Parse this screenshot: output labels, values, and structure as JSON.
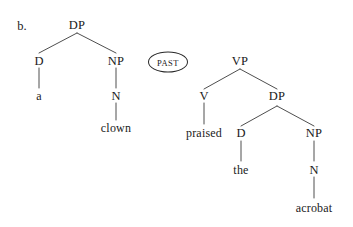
{
  "figure": {
    "item_label": "b.",
    "stroke_color": "#3a3a3a",
    "text_color": "#1a1a1a",
    "background": "#ffffff"
  },
  "tense_node": {
    "label": "PAST",
    "shape": "ellipse"
  },
  "subject_tree": {
    "root": "DP",
    "nodes": {
      "dp": "DP",
      "d": "D",
      "np": "NP",
      "n": "N"
    },
    "terminals": {
      "determiner": "a",
      "noun": "clown"
    }
  },
  "predicate_tree": {
    "root": "VP",
    "nodes": {
      "vp": "VP",
      "v": "V",
      "dp": "DP",
      "d": "D",
      "np": "NP",
      "n": "N"
    },
    "terminals": {
      "verb": "praised",
      "determiner": "the",
      "noun": "acrobat"
    }
  }
}
